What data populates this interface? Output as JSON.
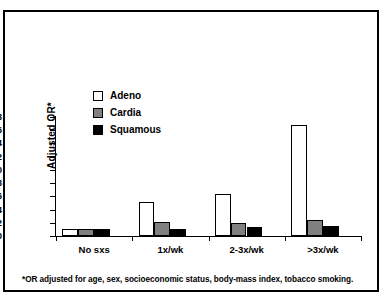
{
  "figure": {
    "axis_title_y": "Adjusted OR*",
    "footnote": "*OR adjusted for age, sex, socioeconomic status, body-mass index, tobacco smoking.",
    "colors": {
      "adeno": "#ffffff",
      "cardia": "#808080",
      "squamous": "#000000",
      "border": "#000000",
      "background": "#ffffff"
    }
  },
  "legend": {
    "position": "upper-left",
    "entries": [
      {
        "label": "Adeno",
        "color": "#ffffff"
      },
      {
        "label": "Cardia",
        "color": "#808080"
      },
      {
        "label": "Squamous",
        "color": "#000000"
      }
    ]
  },
  "chart_data": {
    "type": "bar",
    "title": "",
    "xlabel": "",
    "ylabel": "Adjusted OR*",
    "ylim": [
      0,
      18
    ],
    "ytick_labels": [
      "0",
      "2",
      "4",
      "6",
      "8",
      "10",
      "12",
      "14",
      "16",
      "18"
    ],
    "yticks": [
      0,
      2,
      4,
      6,
      8,
      10,
      12,
      14,
      16,
      18
    ],
    "grid": false,
    "legend_position": "upper-left",
    "categories": [
      "No sxs",
      "1x/wk",
      "2-3x/wk",
      ">3x/wk"
    ],
    "series": [
      {
        "name": "Adeno",
        "color": "#ffffff",
        "values": [
          1.0,
          5.2,
          6.4,
          16.8
        ]
      },
      {
        "name": "Cardia",
        "color": "#808080",
        "values": [
          1.0,
          2.1,
          2.0,
          2.4
        ]
      },
      {
        "name": "Squamous",
        "color": "#000000",
        "values": [
          1.0,
          1.0,
          1.3,
          1.5
        ]
      }
    ],
    "annotations": [
      "*OR adjusted for age, sex, socioeconomic status, body-mass index, tobacco smoking."
    ]
  }
}
